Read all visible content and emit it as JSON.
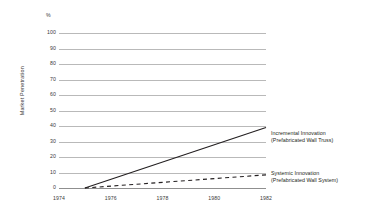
{
  "chart_data": {
    "type": "line",
    "title": "",
    "xlabel": "",
    "ylabel": "Market Penetration",
    "unit_symbol": "%",
    "xlim": [
      1974,
      1982
    ],
    "ylim": [
      0,
      100
    ],
    "grid": true,
    "legend_position": "right-inline",
    "x_ticks": [
      "1974",
      "1976",
      "1978",
      "1980",
      "1982"
    ],
    "x_tick_values": [
      1974,
      1976,
      1978,
      1980,
      1982
    ],
    "y_ticks": [
      "0",
      "10",
      "20",
      "30",
      "40",
      "50",
      "60",
      "70",
      "80",
      "90",
      "100"
    ],
    "y_tick_values": [
      0,
      10,
      20,
      30,
      40,
      50,
      60,
      70,
      80,
      90,
      100
    ],
    "series": [
      {
        "name": "Incremental Innovation",
        "sublabel": "(Prefabricated Wall Truss)",
        "style": "solid",
        "color": "#231f20",
        "x": [
          1975,
          1982
        ],
        "values": [
          0,
          39
        ]
      },
      {
        "name": "Systemic Innovation",
        "sublabel": "(Prefabricated Wall System)",
        "style": "dashed",
        "color": "#231f20",
        "x": [
          1975,
          1982
        ],
        "values": [
          0,
          8.5
        ]
      }
    ]
  },
  "axes": {
    "y_title": "Market Penetration",
    "percent_symbol": "%",
    "y_labels": {
      "t100": "100",
      "t90": "90",
      "t80": "80",
      "t70": "70",
      "t60": "60",
      "t50": "50",
      "t40": "40",
      "t30": "30",
      "t20": "20",
      "t10": "10",
      "t0": "0"
    },
    "x_labels": {
      "x1974": "1974",
      "x1976": "1976",
      "x1978": "1978",
      "x1980": "1980",
      "x1982": "1982"
    }
  },
  "labels": {
    "incremental_line1": "Incremental Innovation",
    "incremental_line2": "(Prefabricated Wall Truss)",
    "systemic_line1": "Systemic Innovation",
    "systemic_line2": "(Prefabricated Wall System)"
  },
  "colors": {
    "gridline": "#b9b9b9",
    "axis": "#8f8f8f",
    "series": "#231f20",
    "text": "#3a3a3a",
    "background": "#ffffff"
  }
}
